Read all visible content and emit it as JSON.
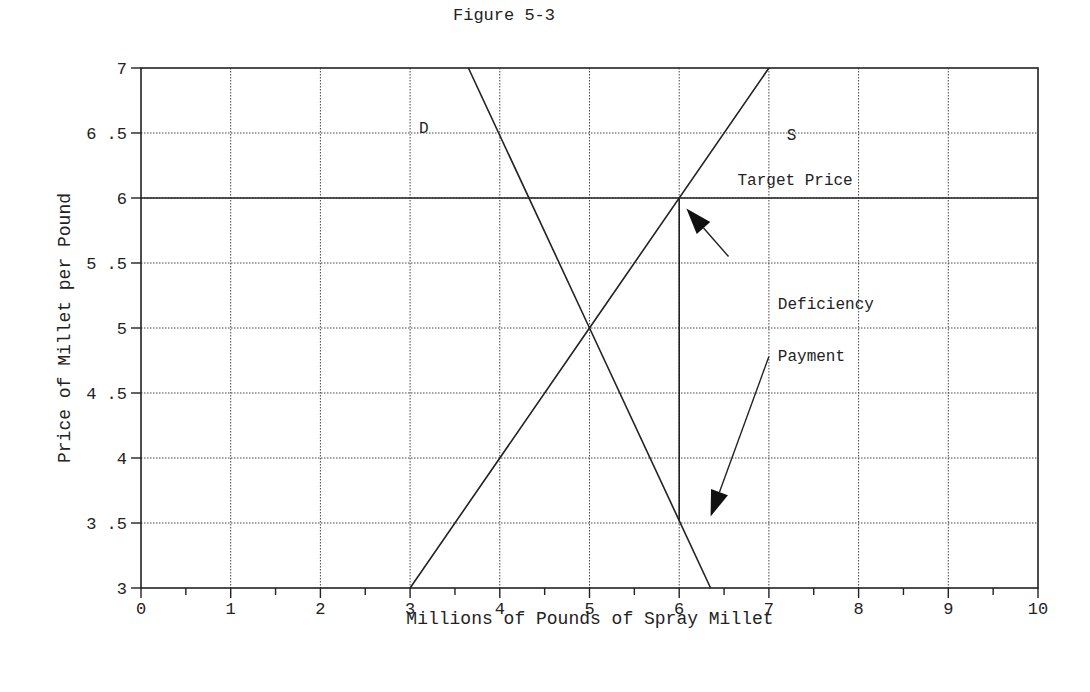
{
  "chart_data": {
    "type": "line",
    "title": "Figure 5-3",
    "xlabel": "Millions of Pounds of Spray Millet",
    "ylabel": "Price of Millet per Pound",
    "xlim": [
      0,
      10
    ],
    "ylim": [
      3,
      7
    ],
    "x_ticks": [
      "0",
      "1",
      "2",
      "3",
      "4",
      "5",
      "6",
      "7",
      "8",
      "9",
      "10"
    ],
    "y_ticks": [
      "3",
      "3.5",
      "4",
      "4.5",
      "5",
      "5.5",
      "6",
      "6.5",
      "7"
    ],
    "grid": true,
    "series": [
      {
        "name": "D",
        "label": "D",
        "points": [
          [
            3.65,
            7
          ],
          [
            5,
            5
          ],
          [
            6.35,
            3
          ]
        ]
      },
      {
        "name": "S",
        "label": "S",
        "points": [
          [
            3,
            3
          ],
          [
            5,
            5
          ],
          [
            7,
            7
          ]
        ]
      },
      {
        "name": "Target Price",
        "label": "Target Price",
        "points": [
          [
            0,
            6
          ],
          [
            10,
            6
          ]
        ]
      },
      {
        "name": "Deficiency payment gap",
        "points": [
          [
            6,
            6
          ],
          [
            6,
            3.52
          ]
        ]
      }
    ],
    "annotations": [
      {
        "text": "D",
        "x": 3.1,
        "y": 6.5
      },
      {
        "text": "S",
        "x": 7.2,
        "y": 6.45
      },
      {
        "text": "Target Price",
        "x": 6.65,
        "y": 6.1
      },
      {
        "text": "Deficiency",
        "x": 7.1,
        "y": 5.15
      },
      {
        "text": "Payment",
        "x": 7.1,
        "y": 4.75
      }
    ],
    "arrows": [
      {
        "from": [
          6.55,
          5.55
        ],
        "to": [
          6.08,
          5.92
        ]
      },
      {
        "from": [
          7.0,
          4.78
        ],
        "to": [
          6.35,
          3.55
        ]
      }
    ],
    "equilibrium": {
      "quantity": 5,
      "price": 5
    },
    "target_price": 6
  }
}
